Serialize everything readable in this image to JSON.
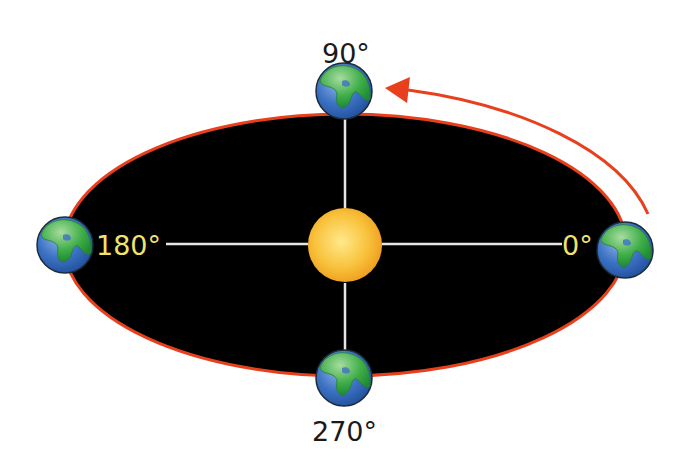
{
  "diagram": {
    "type": "orbit-phase-angles",
    "colors": {
      "background": "#ffffff",
      "orbit_fill": "#000000",
      "orbit_stroke": "#e8401c",
      "arrow": "#e8401c",
      "axis_lines": "#e6e6e6",
      "sun_core": "#ffe27a",
      "sun_edge": "#f0a020",
      "earth_ocean": "#3a6fbf",
      "earth_land": "#3fae49",
      "label_outside": "#1a1a1a",
      "label_inside": "#f2e36a"
    },
    "center": {
      "name": "Sun"
    },
    "positions": [
      {
        "id": "pos-0",
        "angle_label": "0°",
        "label_color": "inside"
      },
      {
        "id": "pos-90",
        "angle_label": "90°",
        "label_color": "outside"
      },
      {
        "id": "pos-180",
        "angle_label": "180°",
        "label_color": "inside"
      },
      {
        "id": "pos-270",
        "angle_label": "270°",
        "label_color": "outside"
      }
    ],
    "orbit_direction": "counterclockwise",
    "arrow": {
      "from": "0°",
      "to": "90°"
    }
  }
}
